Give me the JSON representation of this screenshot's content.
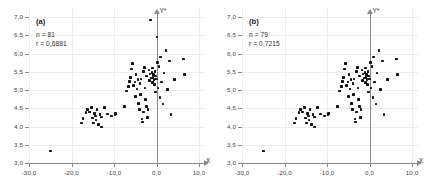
{
  "figure": {
    "background_color": "#ffffff",
    "point_color": "#111111",
    "axis_color": "#8a8a8a",
    "grid_color": "#ededed"
  },
  "chart_data": [
    {
      "type": "scatter",
      "panel": "(a)",
      "title": "",
      "xlabel": "X",
      "ylabel": "Y*",
      "xlim": [
        -30.0,
        10.0
      ],
      "ylim": [
        3.0,
        7.0
      ],
      "grid": true,
      "legend": "none",
      "xticks": [
        -30.0,
        -20.0,
        -10.0,
        0.0,
        10.0
      ],
      "xticklabels": [
        "-30,0",
        "-20,0",
        "-10,0",
        "0,0",
        "10,0"
      ],
      "yticks": [
        3.0,
        3.5,
        4.0,
        4.5,
        5.0,
        5.5,
        6.0,
        6.5,
        7.0
      ],
      "yticklabels": [
        "3,0",
        "3,5",
        "4,0",
        "4,5",
        "5,0",
        "5,5",
        "6,0",
        "6,5",
        "7,0"
      ],
      "annotations": {
        "n_label": "n = 81",
        "r_label": "r = 0,6881",
        "n": 81,
        "r": 0.6881
      },
      "points": [
        [
          -25.0,
          3.33
        ],
        [
          -17.6,
          4.1
        ],
        [
          -17.3,
          4.22
        ],
        [
          -16.6,
          4.38
        ],
        [
          -16.2,
          4.47
        ],
        [
          -15.7,
          4.4
        ],
        [
          -15.3,
          4.52
        ],
        [
          -15.0,
          4.23
        ],
        [
          -14.8,
          4.1
        ],
        [
          -14.6,
          4.35
        ],
        [
          -14.4,
          4.29
        ],
        [
          -14.2,
          4.18
        ],
        [
          -14.0,
          4.46
        ],
        [
          -13.6,
          4.06
        ],
        [
          -13.3,
          4.33
        ],
        [
          -13.0,
          3.99
        ],
        [
          -12.9,
          4.26
        ],
        [
          -12.3,
          4.52
        ],
        [
          -11.5,
          4.34
        ],
        [
          -10.6,
          4.29
        ],
        [
          -9.8,
          4.31
        ],
        [
          -9.6,
          4.35
        ],
        [
          -7.5,
          4.55
        ],
        [
          -7.0,
          4.97
        ],
        [
          -6.6,
          5.1
        ],
        [
          -6.3,
          5.24
        ],
        [
          -6.1,
          5.35
        ],
        [
          -5.9,
          5.57
        ],
        [
          -5.6,
          5.72
        ],
        [
          -5.4,
          5.12
        ],
        [
          -5.1,
          5.22
        ],
        [
          -5.0,
          4.83
        ],
        [
          -4.8,
          5.42
        ],
        [
          -4.6,
          5.03
        ],
        [
          -4.4,
          5.28
        ],
        [
          -4.2,
          4.63
        ],
        [
          -4.0,
          4.47
        ],
        [
          -3.9,
          5.18
        ],
        [
          -3.7,
          4.88
        ],
        [
          -3.6,
          5.3
        ],
        [
          -3.4,
          4.2
        ],
        [
          -3.3,
          4.12
        ],
        [
          -3.1,
          4.4
        ],
        [
          -3.0,
          5.5
        ],
        [
          -2.8,
          5.62
        ],
        [
          -2.7,
          5.05
        ],
        [
          -2.6,
          4.74
        ],
        [
          -2.4,
          5.38
        ],
        [
          -2.3,
          4.55
        ],
        [
          -2.1,
          4.24
        ],
        [
          -2.0,
          4.46
        ],
        [
          -1.8,
          5.55
        ],
        [
          -1.7,
          5.26
        ],
        [
          -1.5,
          5.44
        ],
        [
          -1.4,
          6.92
        ],
        [
          -1.2,
          5.33
        ],
        [
          -1.1,
          5.48
        ],
        [
          -1.0,
          5.2
        ],
        [
          -0.9,
          5.6
        ],
        [
          -0.8,
          5.35
        ],
        [
          -0.7,
          5.42
        ],
        [
          -0.6,
          5.28
        ],
        [
          -0.5,
          5.15
        ],
        [
          -0.4,
          5.5
        ],
        [
          -0.3,
          4.95
        ],
        [
          -0.2,
          5.38
        ],
        [
          0.0,
          5.3
        ],
        [
          0.1,
          6.45
        ],
        [
          0.2,
          5.75
        ],
        [
          0.4,
          5.05
        ],
        [
          0.6,
          5.64
        ],
        [
          0.8,
          4.8
        ],
        [
          1.0,
          5.9
        ],
        [
          1.2,
          5.22
        ],
        [
          1.5,
          4.62
        ],
        [
          1.8,
          5.47
        ],
        [
          2.2,
          6.08
        ],
        [
          2.6,
          5.02
        ],
        [
          3.0,
          5.8
        ],
        [
          3.4,
          4.33
        ],
        [
          4.2,
          5.28
        ],
        [
          6.3,
          5.85
        ],
        [
          6.6,
          5.42
        ]
      ]
    },
    {
      "type": "scatter",
      "panel": "(b)",
      "title": "",
      "xlabel": "X",
      "ylabel": "Y*",
      "xlim": [
        -30.0,
        10.0
      ],
      "ylim": [
        3.0,
        7.0
      ],
      "grid": true,
      "legend": "none",
      "xticks": [
        -30.0,
        -20.0,
        -10.0,
        0.0,
        10.0
      ],
      "xticklabels": [
        "-30,0",
        "-20,0",
        "-10,0",
        "0,0",
        "10,0"
      ],
      "yticks": [
        3.0,
        3.5,
        4.0,
        4.5,
        5.0,
        5.5,
        6.0,
        6.5,
        7.0
      ],
      "yticklabels": [
        "3,0",
        "3,5",
        "4,0",
        "4,5",
        "5,0",
        "5,5",
        "6,0",
        "6,5",
        "7,0"
      ],
      "annotations": {
        "n_label": "n = 79",
        "r_label": "r = 0,7215",
        "n": 79,
        "r": 0.7215
      },
      "points": [
        [
          -25.0,
          3.33
        ],
        [
          -17.6,
          4.1
        ],
        [
          -17.3,
          4.22
        ],
        [
          -16.6,
          4.38
        ],
        [
          -16.2,
          4.47
        ],
        [
          -15.7,
          4.4
        ],
        [
          -15.3,
          4.52
        ],
        [
          -15.0,
          4.23
        ],
        [
          -14.8,
          4.1
        ],
        [
          -14.6,
          4.35
        ],
        [
          -14.4,
          4.29
        ],
        [
          -14.2,
          4.18
        ],
        [
          -14.0,
          4.46
        ],
        [
          -13.6,
          4.06
        ],
        [
          -13.3,
          4.33
        ],
        [
          -13.0,
          3.99
        ],
        [
          -12.9,
          4.26
        ],
        [
          -12.3,
          4.52
        ],
        [
          -11.5,
          4.34
        ],
        [
          -10.6,
          4.29
        ],
        [
          -9.8,
          4.31
        ],
        [
          -9.6,
          4.35
        ],
        [
          -7.5,
          4.55
        ],
        [
          -7.0,
          4.97
        ],
        [
          -6.6,
          5.1
        ],
        [
          -6.3,
          5.24
        ],
        [
          -6.1,
          5.35
        ],
        [
          -5.9,
          5.57
        ],
        [
          -5.6,
          5.72
        ],
        [
          -5.4,
          5.12
        ],
        [
          -5.1,
          5.22
        ],
        [
          -5.0,
          4.83
        ],
        [
          -4.8,
          5.42
        ],
        [
          -4.6,
          5.03
        ],
        [
          -4.4,
          5.28
        ],
        [
          -4.2,
          4.63
        ],
        [
          -4.0,
          4.47
        ],
        [
          -3.9,
          5.18
        ],
        [
          -3.7,
          4.88
        ],
        [
          -3.6,
          5.3
        ],
        [
          -3.4,
          4.2
        ],
        [
          -3.3,
          4.12
        ],
        [
          -3.1,
          4.4
        ],
        [
          -3.0,
          5.5
        ],
        [
          -2.8,
          5.62
        ],
        [
          -2.7,
          5.05
        ],
        [
          -2.6,
          4.74
        ],
        [
          -2.4,
          5.38
        ],
        [
          -2.3,
          4.55
        ],
        [
          -2.1,
          4.24
        ],
        [
          -2.0,
          4.46
        ],
        [
          -1.8,
          5.55
        ],
        [
          -1.7,
          5.26
        ],
        [
          -1.5,
          5.44
        ],
        [
          -1.2,
          5.33
        ],
        [
          -1.1,
          5.48
        ],
        [
          -1.0,
          5.2
        ],
        [
          -0.9,
          5.6
        ],
        [
          -0.8,
          5.35
        ],
        [
          -0.7,
          5.42
        ],
        [
          -0.6,
          5.28
        ],
        [
          -0.5,
          5.15
        ],
        [
          -0.4,
          5.5
        ],
        [
          -0.3,
          4.95
        ],
        [
          -0.2,
          5.38
        ],
        [
          0.0,
          5.3
        ],
        [
          0.2,
          5.75
        ],
        [
          0.4,
          5.05
        ],
        [
          0.6,
          5.64
        ],
        [
          0.8,
          4.8
        ],
        [
          1.0,
          5.9
        ],
        [
          1.2,
          5.22
        ],
        [
          1.5,
          4.62
        ],
        [
          1.8,
          5.47
        ],
        [
          2.2,
          6.08
        ],
        [
          2.6,
          5.02
        ],
        [
          3.0,
          5.8
        ],
        [
          3.4,
          4.33
        ],
        [
          4.2,
          5.28
        ],
        [
          6.3,
          5.85
        ],
        [
          6.6,
          5.42
        ]
      ]
    }
  ]
}
